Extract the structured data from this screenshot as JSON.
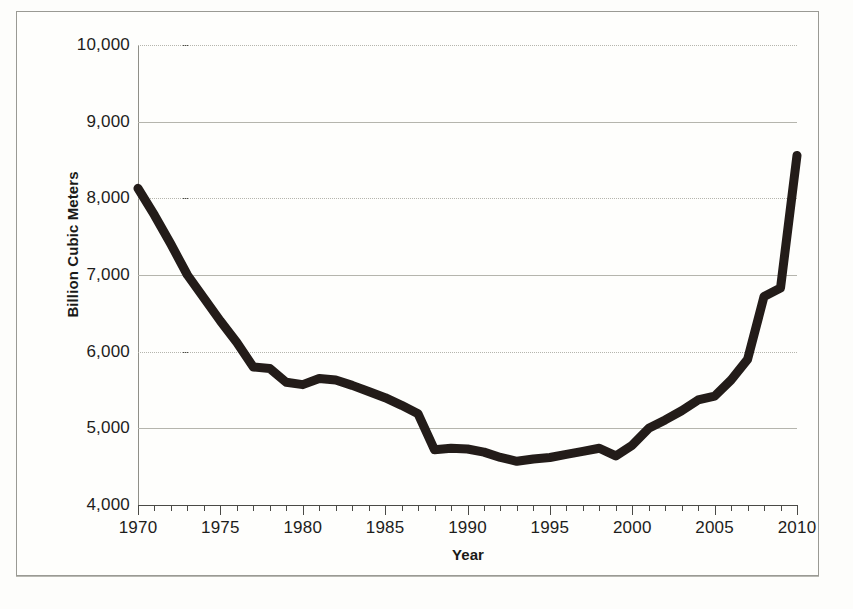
{
  "chart_data": {
    "type": "line",
    "title": "",
    "xlabel": "Year",
    "ylabel": "Billion Cubic Meters",
    "xlim": [
      1970,
      2010
    ],
    "ylim": [
      4000,
      10000
    ],
    "ytick_labels": [
      "10,000",
      "9,000",
      "8,000",
      "7,000",
      "6,000",
      "5,000",
      "4,000"
    ],
    "ytick_values": [
      10000,
      9000,
      8000,
      7000,
      6000,
      5000,
      4000
    ],
    "xtick_labels": [
      "1970",
      "1975",
      "1980",
      "1985",
      "1990",
      "1995",
      "2000",
      "2005",
      "2010"
    ],
    "xtick_values": [
      1970,
      1975,
      1980,
      1985,
      1990,
      1995,
      2000,
      2005,
      2010
    ],
    "x_minor_tick_interval": 1,
    "grid": "horizontal",
    "legend": "none",
    "line_color": "#231c19",
    "line_width_px": 9,
    "x": [
      1970,
      1971,
      1972,
      1973,
      1974,
      1975,
      1976,
      1977,
      1978,
      1979,
      1980,
      1981,
      1982,
      1983,
      1984,
      1985,
      1986,
      1987,
      1988,
      1989,
      1990,
      1991,
      1992,
      1993,
      1994,
      1995,
      1996,
      1997,
      1998,
      1999,
      2000,
      2001,
      2002,
      2003,
      2004,
      2005,
      2006,
      2007,
      2008,
      2009,
      2010
    ],
    "values": [
      8130,
      7780,
      7400,
      7000,
      6700,
      6400,
      6120,
      5800,
      5780,
      5600,
      5570,
      5650,
      5630,
      5560,
      5480,
      5400,
      5300,
      5190,
      4720,
      4740,
      4730,
      4690,
      4620,
      4570,
      4600,
      4620,
      4660,
      4700,
      4740,
      4640,
      4780,
      5000,
      5110,
      5230,
      5370,
      5420,
      5630,
      5900,
      6720,
      6830,
      8560
    ],
    "series_name": "Billion Cubic Meters"
  },
  "axes": {
    "y_title": "Billion Cubic Meters",
    "x_title": "Year"
  }
}
